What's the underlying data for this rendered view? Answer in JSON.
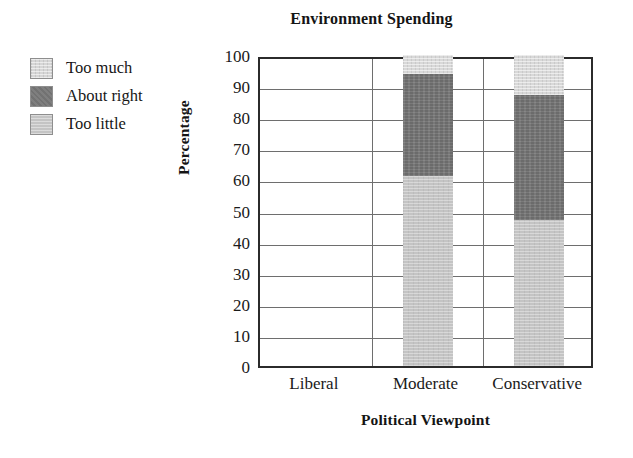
{
  "chart_data": {
    "type": "bar",
    "subtype": "stacked-bar",
    "title": "Environment Spending",
    "xlabel": "Political Viewpoint",
    "ylabel": "Percentage",
    "categories": [
      "Liberal",
      "Moderate",
      "Conservative"
    ],
    "series": [
      {
        "name": "Too little",
        "values": [
          0,
          61,
          47
        ],
        "color": "#c4c4c4"
      },
      {
        "name": "About right",
        "values": [
          0,
          33,
          40
        ],
        "color": "#787878"
      },
      {
        "name": "Too much",
        "values": [
          0,
          6,
          13
        ],
        "color": "#d8d8d8"
      }
    ],
    "cumulative_tops": {
      "Liberal": [
        0,
        0,
        0
      ],
      "Moderate": [
        61,
        94,
        100
      ],
      "Conservative": [
        47,
        87,
        100
      ]
    },
    "ylim": [
      0,
      100
    ],
    "yticks": [
      "0",
      "10",
      "20",
      "30",
      "40",
      "50",
      "60",
      "70",
      "80",
      "90",
      "100"
    ],
    "grid": "horizontal-and-vertical",
    "legend_position": "outside-left-top"
  },
  "legend": {
    "items": [
      {
        "label": "Too much",
        "swatch": "legend-swatch-too-much"
      },
      {
        "label": "About right",
        "swatch": "legend-swatch-about-right"
      },
      {
        "label": "Too little",
        "swatch": "legend-swatch-too-little"
      }
    ]
  },
  "colors": {
    "too_much": "#d8d8d8",
    "about_right": "#787878",
    "too_little": "#c4c4c4",
    "axis": "#2b2b2b",
    "grid": "#6e6e6e",
    "text": "#1a1a1a",
    "background": "#ffffff"
  }
}
